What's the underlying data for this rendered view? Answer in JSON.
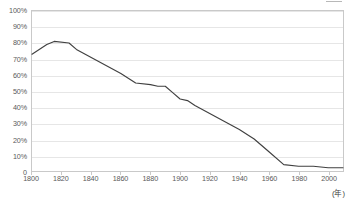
{
  "chart_data": {
    "type": "line",
    "title": "",
    "subtitle": "",
    "xlabel": "(年)",
    "ylabel": "",
    "xlim": [
      1800,
      2010
    ],
    "ylim": [
      0,
      100
    ],
    "grid": true,
    "legend_position": "top-right",
    "x_tick_labels": [
      "1800",
      "1820",
      "1840",
      "1860",
      "1880",
      "1900",
      "1920",
      "1940",
      "1960",
      "1980",
      "2000"
    ],
    "x_ticks": [
      1800,
      1820,
      1840,
      1860,
      1880,
      1900,
      1920,
      1940,
      1960,
      1980,
      2000
    ],
    "y_tick_labels": [
      "100%",
      "90%",
      "80%",
      "70%",
      "60%",
      "50%",
      "40%",
      "30%",
      "20%",
      "10%",
      "0"
    ],
    "y_ticks": [
      100,
      90,
      80,
      70,
      60,
      50,
      40,
      30,
      20,
      10,
      0
    ],
    "series": [
      {
        "name": "",
        "color": "#404040",
        "x": [
          1800,
          1810,
          1815,
          1825,
          1830,
          1840,
          1850,
          1860,
          1870,
          1880,
          1885,
          1890,
          1895,
          1900,
          1905,
          1910,
          1920,
          1930,
          1940,
          1950,
          1960,
          1970,
          1980,
          1990,
          2000,
          2010
        ],
        "values": [
          73,
          79,
          81,
          80,
          76,
          71,
          66,
          61,
          55,
          54,
          53,
          53,
          49,
          45,
          44,
          41,
          36,
          31,
          26,
          20,
          12,
          4,
          3,
          3,
          2,
          2
        ]
      }
    ]
  },
  "axis": {
    "unit_label": "(年)"
  },
  "legend": {
    "label": ""
  },
  "colors": {
    "line": "#404040",
    "grid": "#e6e6e6",
    "frame": "#c9c9c9",
    "tick_text": "#595959",
    "background": "#ffffff"
  }
}
